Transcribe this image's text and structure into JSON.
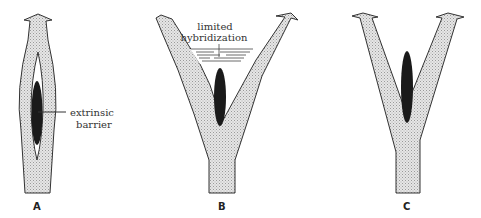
{
  "figure": {
    "panels": [
      {
        "id": "A",
        "label": "A",
        "shape": "single lineage with internal split and extrinsic barrier"
      },
      {
        "id": "B",
        "label": "B",
        "shape": "Y-shaped branching lineage with limited hybridization zone"
      },
      {
        "id": "C",
        "label": "C",
        "shape": "Y-shaped branching lineage with barrier and no hybridization"
      }
    ],
    "annotations": {
      "extrinsic_barrier_line1": "extrinsic",
      "extrinsic_barrier_line2": "barrier",
      "limited_hybridization_line1": "limited",
      "limited_hybridization_line2": "hybridization"
    },
    "colors": {
      "lineage_fill": "#d9d9d9",
      "barrier_fill": "#1a1a1a",
      "outline": "#333333",
      "background": "#ffffff"
    }
  }
}
